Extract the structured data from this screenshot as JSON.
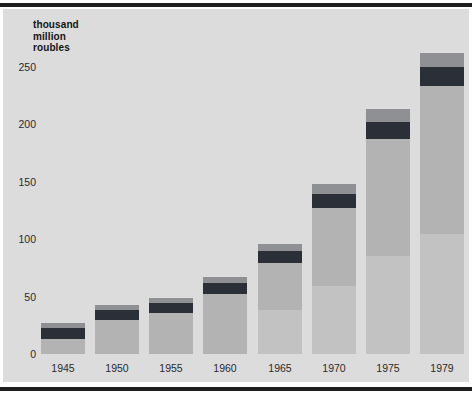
{
  "chart_data": {
    "type": "bar",
    "title": "",
    "ylabel": "thousand million roubles",
    "ylabel_lines": [
      "thousand",
      "million",
      "roubles"
    ],
    "xlabel": "",
    "categories": [
      "1945",
      "1950",
      "1955",
      "1960",
      "1965",
      "1970",
      "1975",
      "1979"
    ],
    "values": [
      27,
      43,
      49,
      67,
      96,
      148,
      213,
      262
    ],
    "ylim": [
      0,
      275
    ],
    "yticks": [
      0,
      50,
      100,
      150,
      200,
      250
    ],
    "ytick_labels": [
      "0",
      "50",
      "100",
      "150",
      "200",
      "250"
    ],
    "grid": false,
    "legend": "none",
    "series": [
      {
        "name": "total",
        "values": [
          27,
          43,
          49,
          67,
          96,
          148,
          213,
          262
        ]
      }
    ],
    "bar_segments": {
      "note": "each bar is drawn with a light-grey cap, a dark band below it and a medium grey body",
      "cap_height": [
        5,
        5,
        5,
        6,
        7,
        10,
        13,
        14
      ],
      "band_height": [
        11,
        10,
        10,
        11,
        12,
        14,
        17,
        19
      ]
    },
    "colors": {
      "panel_background": "#dcdcdc",
      "bar_body": "#b3b3b3",
      "bar_lower": "#c2c2c2",
      "bar_band": "#2b2f38",
      "bar_cap": "#8f9094",
      "rule": "#1d1d1d",
      "text": "#2a2a2a"
    }
  }
}
